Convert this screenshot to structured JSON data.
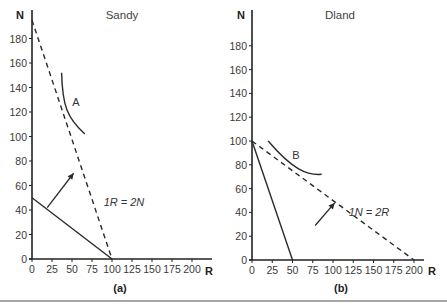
{
  "chart_data": [
    {
      "type": "line",
      "title": "Sandy",
      "caption": "(a)",
      "xlabel": "R",
      "ylabel": "N",
      "xlim": [
        0,
        200
      ],
      "ylim": [
        0,
        190
      ],
      "xticks": [
        0,
        25,
        50,
        75,
        100,
        125,
        150,
        175,
        200
      ],
      "yticks": [
        0,
        20,
        40,
        60,
        80,
        100,
        120,
        140,
        160,
        180
      ],
      "grid": false,
      "series": [
        {
          "name": "production possibility (solid)",
          "style": "solid",
          "points": [
            [
              0,
              50
            ],
            [
              100,
              0
            ]
          ]
        },
        {
          "name": "1R = 2N (dashed)",
          "style": "dashed",
          "points": [
            [
              0,
              195
            ],
            [
              100,
              0
            ]
          ]
        },
        {
          "name": "indifference curve A",
          "style": "curve",
          "points": [
            [
              37,
              152
            ],
            [
              38,
              125
            ],
            [
              44,
              115
            ],
            [
              66,
              102
            ]
          ]
        }
      ],
      "annotations": [
        {
          "text": "A",
          "at": [
            55,
            128
          ]
        },
        {
          "text": "1R = 2N",
          "at": [
            90,
            47
          ]
        },
        {
          "text": "arrow",
          "from": [
            19,
            42
          ],
          "to": [
            52,
            70
          ]
        }
      ]
    },
    {
      "type": "line",
      "title": "Dland",
      "caption": "(b)",
      "xlabel": "R",
      "ylabel": "N",
      "xlim": [
        0,
        200
      ],
      "ylim": [
        0,
        190
      ],
      "xticks": [
        0,
        25,
        50,
        75,
        100,
        125,
        150,
        175,
        200
      ],
      "yticks": [
        0,
        20,
        40,
        60,
        80,
        100,
        120,
        140,
        160,
        180
      ],
      "grid": false,
      "series": [
        {
          "name": "production possibility (solid)",
          "style": "solid",
          "points": [
            [
              0,
              100
            ],
            [
              50,
              0
            ]
          ]
        },
        {
          "name": "1N = 2R (dashed)",
          "style": "dashed",
          "points": [
            [
              0,
              100
            ],
            [
              200,
              0
            ]
          ]
        },
        {
          "name": "indifference curve B",
          "style": "curve",
          "points": [
            [
              20,
              100
            ],
            [
              50,
              76
            ],
            [
              68,
              71
            ],
            [
              86,
              72
            ]
          ]
        }
      ],
      "annotations": [
        {
          "text": "B",
          "at": [
            55,
            86
          ]
        },
        {
          "text": "1N = 2R",
          "at": [
            140,
            38
          ]
        },
        {
          "text": "arrow",
          "from": [
            78,
            29
          ],
          "to": [
            102,
            48
          ]
        }
      ]
    }
  ],
  "panels": [
    {
      "title": "Sandy",
      "caption": "(a)",
      "equation": "1R = 2N",
      "curve_label": "A",
      "x_axis_label": "R",
      "y_axis_label": "N",
      "xtick_labels": [
        "0",
        "25",
        "50",
        "75",
        "100",
        "125",
        "150",
        "175",
        "200"
      ],
      "ytick_labels": [
        "0",
        "20",
        "40",
        "60",
        "80",
        "100",
        "120",
        "140",
        "160",
        "180"
      ]
    },
    {
      "title": "Dland",
      "caption": "(b)",
      "equation": "1N = 2R",
      "curve_label": "B",
      "x_axis_label": "R",
      "y_axis_label": "N",
      "xtick_labels": [
        "0",
        "25",
        "50",
        "75",
        "100",
        "125",
        "150",
        "175",
        "200"
      ],
      "ytick_labels": [
        "0",
        "20",
        "40",
        "60",
        "80",
        "100",
        "120",
        "140",
        "160",
        "180"
      ]
    }
  ],
  "colors": {
    "line": "#2a2a2a",
    "axis": "#222222",
    "rule": "#8a8a8a"
  }
}
